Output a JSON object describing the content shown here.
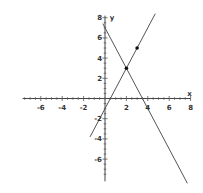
{
  "chart_data": {
    "type": "line",
    "title": "",
    "xlabel": "x",
    "ylabel": "y",
    "xlim": [
      -8,
      8
    ],
    "ylim": [
      -8,
      8
    ],
    "grid": false,
    "x_ticks": [
      -6,
      -4,
      -2,
      2,
      4,
      6,
      8
    ],
    "y_ticks": [
      8,
      6,
      4,
      2,
      -2,
      -4,
      -6
    ],
    "series": [
      {
        "name": "line-1",
        "equation": "y = 2x - 1",
        "x": [
          -1.4,
          4.7
        ],
        "y": [
          -3.8,
          8.4
        ]
      },
      {
        "name": "line-2",
        "equation": "y = -2x + 7",
        "x": [
          -0.2,
          7.7
        ],
        "y": [
          7.4,
          -8.4
        ]
      }
    ],
    "points": [
      {
        "x": 2,
        "y": 3,
        "label": "intersection"
      },
      {
        "x": 3,
        "y": 5
      }
    ]
  },
  "axes": {
    "x_label": "x",
    "y_label": "y",
    "x_tick_labels": [
      "-6",
      "-4",
      "-2",
      "2",
      "4",
      "6",
      "8"
    ],
    "y_tick_labels": [
      "8",
      "6",
      "4",
      "2",
      "-2",
      "-4",
      "-6"
    ]
  }
}
